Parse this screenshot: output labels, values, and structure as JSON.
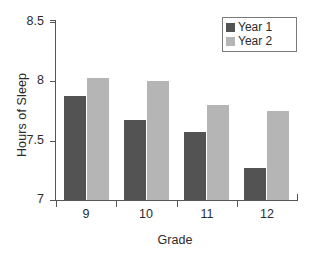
{
  "chart_data": {
    "type": "bar",
    "title": "",
    "xlabel": "Grade",
    "ylabel": "Hours of Sleep",
    "categories": [
      "9",
      "10",
      "11",
      "12"
    ],
    "series": [
      {
        "name": "Year 1",
        "color": "#535353",
        "values": [
          7.88,
          7.67,
          7.57,
          7.27
        ]
      },
      {
        "name": "Year 2",
        "color": "#b5b5b5",
        "values": [
          8.03,
          8.0,
          7.8,
          7.75
        ]
      }
    ],
    "ylim": [
      7,
      8.5
    ],
    "yticks": [
      7,
      7.5,
      8,
      8.5
    ],
    "ytick_labels": [
      "7",
      "7.5",
      "8",
      "8.5"
    ],
    "grid": false,
    "legend_position": "top-right",
    "background": "#ffffff",
    "axis_color": "#555555"
  },
  "legend": {
    "items": [
      {
        "label": "Year 1"
      },
      {
        "label": "Year 2"
      }
    ]
  }
}
